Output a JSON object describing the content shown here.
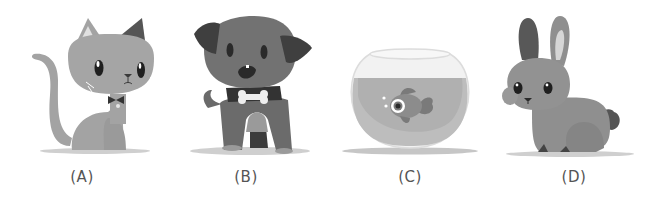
{
  "figure": {
    "panels": [
      {
        "id": "A",
        "label": "(A)",
        "animal": "cat",
        "icon": "cat-icon"
      },
      {
        "id": "B",
        "label": "(B)",
        "animal": "dog",
        "icon": "dog-icon"
      },
      {
        "id": "C",
        "label": "(C)",
        "animal": "goldfish in bowl",
        "icon": "fishbowl-icon"
      },
      {
        "id": "D",
        "label": "(D)",
        "animal": "rabbit",
        "icon": "rabbit-icon"
      }
    ]
  },
  "colors": {
    "body_gray": "#a3a3a3",
    "dark_gray": "#5e5e5e",
    "mid_gray": "#7d7d7d",
    "light_gray": "#d4d4d4",
    "shadow": "#c8c8c8",
    "label": "#555555"
  }
}
